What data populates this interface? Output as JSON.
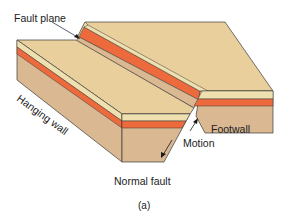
{
  "figure": {
    "title": "Normal fault",
    "panel_label": "(a)",
    "labels": {
      "fault_plane": "Fault plane",
      "hanging_wall": "Hanging wall",
      "footwall": "Footwall",
      "motion": "Motion"
    },
    "colors": {
      "top_surface": "#e8cf9c",
      "top_layer": "#efe0b0",
      "red_layer": "#ec6a3c",
      "side_face": "#d9b892",
      "outline": "#3a3a3a",
      "arrow": "#2a3a55"
    }
  }
}
